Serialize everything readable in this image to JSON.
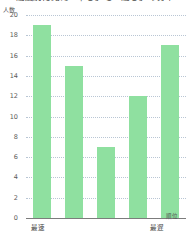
{
  "chart_data": {
    "type": "bar",
    "title": "速度別に見た「早さ」と「速さ」の分布",
    "xlabel": "順位",
    "ylabel": "人数",
    "categories": [
      "1",
      "2",
      "3",
      "4",
      "5"
    ],
    "values": [
      19,
      15,
      7,
      12,
      17
    ],
    "ylim": [
      0,
      20
    ],
    "ytick_labels": [
      "20",
      "18",
      "16",
      "14",
      "12",
      "10",
      "8",
      "6",
      "4",
      "2",
      "0"
    ],
    "ytick_values": [
      20,
      18,
      16,
      14,
      12,
      10,
      8,
      6,
      4,
      2,
      0
    ],
    "grid": true,
    "legend": false,
    "bar_color": "#8fe0a0",
    "grid_color": "#b9c6d4",
    "axis_color": "#7c7c7c",
    "x_axis_annotations": {
      "left": "最速",
      "right": "最遅"
    }
  }
}
